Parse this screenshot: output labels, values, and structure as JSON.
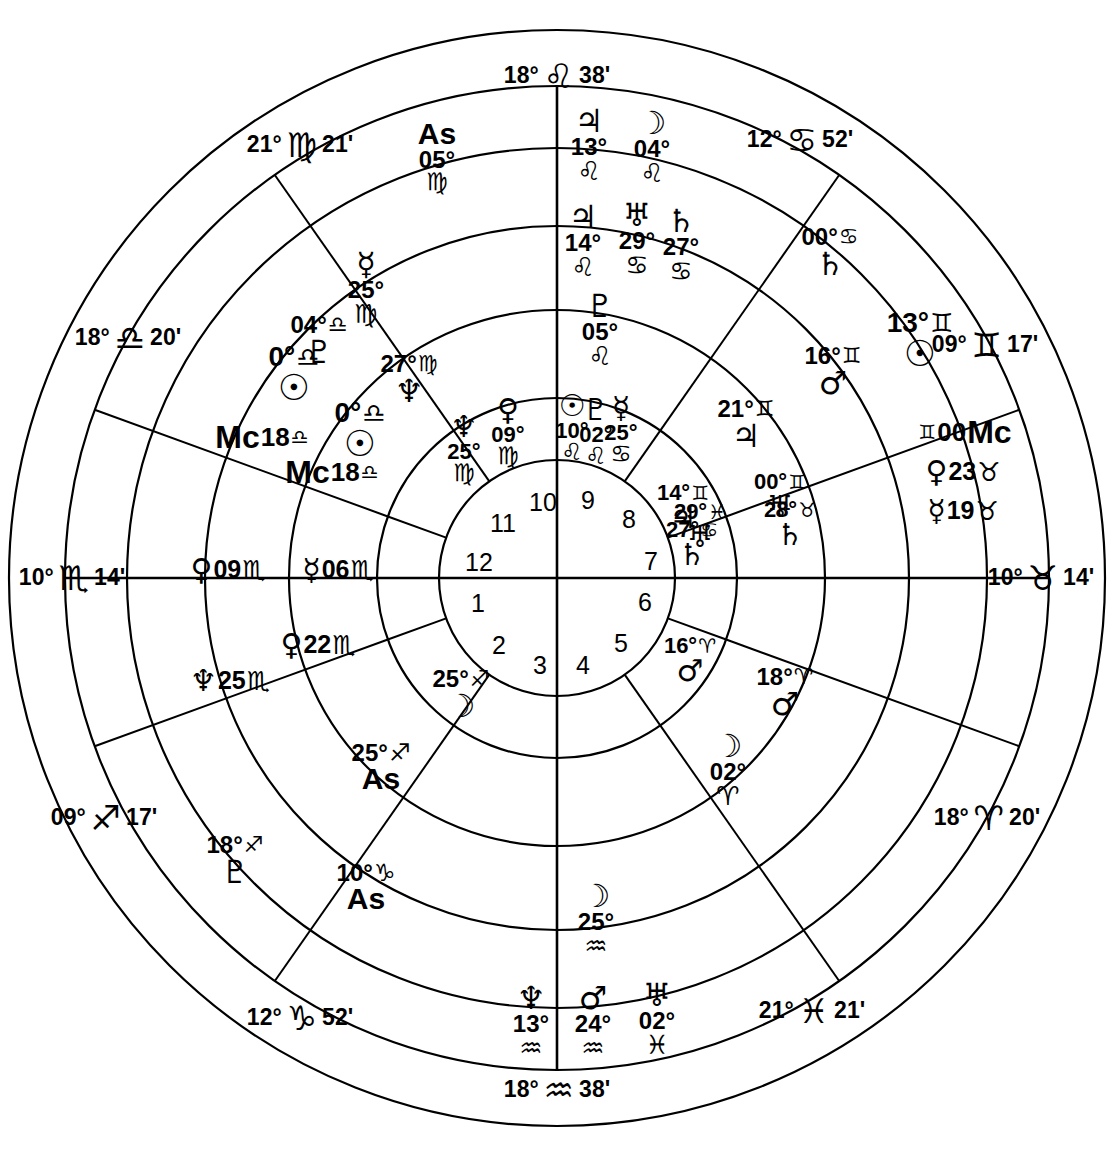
{
  "chart": {
    "type": "astrological-natal-wheel",
    "center": {
      "x": 557,
      "y": 578
    },
    "radii": {
      "outer": 548,
      "signring": 492,
      "ring3": 430,
      "ring2": 352,
      "ring1": 268,
      "housering": 180,
      "hub": 118
    },
    "glyphs": {
      "aries": "♈",
      "taurus": "♉",
      "gemini": "♊",
      "cancer": "♋",
      "leo": "♌",
      "virgo": "♍",
      "libra": "♎",
      "scorpio": "♏",
      "sagittarius": "♐",
      "capricorn": "♑",
      "aquarius": "♒",
      "pisces": "♓",
      "sun": "☉",
      "moon": "☽",
      "mercury": "☿",
      "venus": "♀",
      "mars": "♂",
      "jupiter": "♃",
      "saturn": "♄",
      "uranus": "♅",
      "neptune": "♆",
      "pluto": "♇"
    },
    "house_numbers": [
      {
        "n": "1",
        "x": 478,
        "y": 603
      },
      {
        "n": "2",
        "x": 499,
        "y": 645
      },
      {
        "n": "3",
        "x": 540,
        "y": 665
      },
      {
        "n": "4",
        "x": 583,
        "y": 665
      },
      {
        "n": "5",
        "x": 621,
        "y": 643
      },
      {
        "n": "6",
        "x": 645,
        "y": 602
      },
      {
        "n": "7",
        "x": 651,
        "y": 561
      },
      {
        "n": "8",
        "x": 629,
        "y": 519
      },
      {
        "n": "9",
        "x": 588,
        "y": 500
      },
      {
        "n": "10",
        "x": 543,
        "y": 502
      },
      {
        "n": "11",
        "x": 503,
        "y": 523
      },
      {
        "n": "12",
        "x": 479,
        "y": 562
      }
    ],
    "cusps": [
      {
        "name": "cusp-10-mc",
        "deg": "18°",
        "sign": "leo",
        "min": "38'",
        "x": 557,
        "y": 76,
        "rot": 0
      },
      {
        "name": "cusp-11",
        "deg": "12°",
        "sign": "cancer",
        "min": "52'",
        "x": 800,
        "y": 140,
        "rot": 0
      },
      {
        "name": "cusp-12",
        "deg": "09°",
        "sign": "gemini",
        "min": "17'",
        "x": 985,
        "y": 345,
        "rot": 0
      },
      {
        "name": "cusp-1-asc",
        "deg": "10°",
        "sign": "taurus",
        "min": "14'",
        "x": 1041,
        "y": 578,
        "rot": 0
      },
      {
        "name": "cusp-2",
        "deg": "18°",
        "sign": "aries",
        "min": "20'",
        "x": 987,
        "y": 818,
        "rot": 0
      },
      {
        "name": "cusp-3",
        "deg": "21°",
        "sign": "pisces",
        "min": "21'",
        "x": 812,
        "y": 1011,
        "rot": 0
      },
      {
        "name": "cusp-4-ic",
        "deg": "18°",
        "sign": "aquarius",
        "min": "38'",
        "x": 557,
        "y": 1090,
        "rot": 0
      },
      {
        "name": "cusp-5",
        "deg": "12°",
        "sign": "capricorn",
        "min": "52'",
        "x": 300,
        "y": 1018,
        "rot": 0
      },
      {
        "name": "cusp-6",
        "deg": "09°",
        "sign": "sagittarius",
        "min": "17'",
        "x": 104,
        "y": 818,
        "rot": 0
      },
      {
        "name": "cusp-7-dsc",
        "deg": "10°",
        "sign": "scorpio",
        "min": "14'",
        "x": 72,
        "y": 578,
        "rot": 0
      },
      {
        "name": "cusp-8",
        "deg": "18°",
        "sign": "libra",
        "min": "20'",
        "x": 128,
        "y": 338,
        "rot": 0
      },
      {
        "name": "cusp-9",
        "deg": "21°",
        "sign": "virgo",
        "min": "21'",
        "x": 300,
        "y": 145,
        "rot": 0
      }
    ],
    "placements": [
      {
        "name": "ring3-asc-virgo",
        "ring": "ring3",
        "body": "As",
        "deg": "05°",
        "sign": "virgo",
        "x": 437,
        "y": 157,
        "layout": "as-stack",
        "size": 30
      },
      {
        "name": "ring3-jupiter-leo",
        "ring": "ring3",
        "body": "jupiter",
        "deg": "13°",
        "sign": "leo",
        "x": 589,
        "y": 145,
        "layout": "v-stack",
        "size": 28
      },
      {
        "name": "ring3-moon-leo",
        "ring": "ring3",
        "body": "moon",
        "deg": "04°",
        "sign": "leo",
        "x": 652,
        "y": 147,
        "layout": "v-stack",
        "size": 28
      },
      {
        "name": "ring3-saturn-cancer",
        "ring": "ring3",
        "body": "saturn",
        "deg": "00°",
        "sign": "cancer",
        "x": 830,
        "y": 253,
        "layout": "diag-1",
        "size": 28
      },
      {
        "name": "ring3-mars-gemini",
        "ring": "ring3",
        "body": "mars",
        "deg": "16°",
        "sign": "gemini",
        "x": 833,
        "y": 372,
        "layout": "diag-2",
        "size": 28
      },
      {
        "name": "ring3-sun-gemini",
        "ring": "ring3",
        "body": "sun",
        "deg": "13°",
        "sign": "gemini",
        "x": 920,
        "y": 340,
        "layout": "diag-2",
        "size": 32
      },
      {
        "name": "ring3-mc-gemini",
        "ring": "ring3",
        "body": "Mc",
        "deg": "00°",
        "sign": "gemini",
        "x": 965,
        "y": 432,
        "layout": "mc",
        "size": 30
      },
      {
        "name": "ring3-venus-taurus",
        "ring": "ring3",
        "body": "venus",
        "deg": "23°",
        "sign": "taurus",
        "x": 963,
        "y": 472,
        "layout": "h-row",
        "size": 28
      },
      {
        "name": "ring3-mercury-taurus",
        "ring": "ring3",
        "body": "mercury",
        "deg": "19°",
        "sign": "taurus",
        "x": 963,
        "y": 511,
        "layout": "h-row",
        "size": 28
      },
      {
        "name": "ring3-mars-aries",
        "ring": "ring3",
        "body": "mars",
        "deg": "18°",
        "sign": "aries",
        "x": 785,
        "y": 693,
        "layout": "diag-3",
        "size": 28
      },
      {
        "name": "ring3-moon-aries",
        "ring": "ring3",
        "body": "moon",
        "deg": "02°",
        "sign": "aries",
        "x": 728,
        "y": 770,
        "layout": "v-stack",
        "size": 28
      },
      {
        "name": "ring3-mars-aquarius",
        "ring": "ring3",
        "body": "mars",
        "deg": "24°",
        "sign": "aquarius",
        "x": 593,
        "y": 1022,
        "layout": "v-stack",
        "size": 28
      },
      {
        "name": "ring3-uranus-pisces",
        "ring": "ring3",
        "body": "uranus",
        "deg": "02°",
        "sign": "pisces",
        "x": 657,
        "y": 1019,
        "layout": "v-stack",
        "size": 28
      },
      {
        "name": "ring3-neptune-aqu",
        "ring": "ring3",
        "body": "neptune",
        "deg": "13°",
        "sign": "aquarius",
        "x": 531,
        "y": 1022,
        "layout": "v-stack",
        "size": 28
      },
      {
        "name": "ring3-asc-capricorn",
        "ring": "ring3",
        "body": "As",
        "deg": "10°",
        "sign": "capricorn",
        "x": 366,
        "y": 888,
        "layout": "as-stack2",
        "size": 30
      },
      {
        "name": "ring3-pluto-sag",
        "ring": "ring3",
        "body": "pluto",
        "deg": "18°",
        "sign": "sagittarius",
        "x": 235,
        "y": 861,
        "layout": "diag-4",
        "size": 28
      },
      {
        "name": "ring3-neptune-scorp",
        "ring": "ring3",
        "body": "neptune",
        "deg": "25°",
        "sign": "scorpio",
        "x": 230,
        "y": 681,
        "layout": "h-row",
        "size": 28
      },
      {
        "name": "ring3-venus-scorpio",
        "ring": "ring3",
        "body": "venus",
        "deg": "09°",
        "sign": "scorpio",
        "x": 228,
        "y": 570,
        "layout": "h-row",
        "size": 28
      },
      {
        "name": "ring3-pluto-libra",
        "ring": "ring3",
        "body": "pluto",
        "deg": "04°",
        "sign": "libra",
        "x": 319,
        "y": 341,
        "layout": "diag-5",
        "size": 28
      },
      {
        "name": "ring3-sun-libra",
        "ring": "ring3",
        "body": "sun",
        "deg": "0°",
        "sign": "libra",
        "x": 294,
        "y": 374,
        "layout": "diag-5",
        "size": 32
      },
      {
        "name": "ring3-mc-libra",
        "ring": "ring3",
        "body": "Mc",
        "deg": "18°",
        "sign": "libra",
        "x": 262,
        "y": 437,
        "layout": "mc2",
        "size": 30
      },
      {
        "name": "ring2-jupiter-leo",
        "ring": "ring2",
        "body": "jupiter",
        "deg": "14°",
        "sign": "leo",
        "x": 583,
        "y": 241,
        "layout": "v-stack",
        "size": 28
      },
      {
        "name": "ring2-uranus-cancer",
        "ring": "ring2",
        "body": "uranus",
        "deg": "29°",
        "sign": "cancer",
        "x": 637,
        "y": 239,
        "layout": "v-stack",
        "size": 28
      },
      {
        "name": "ring2-saturn-cancer",
        "ring": "ring2",
        "body": "saturn",
        "deg": "27°",
        "sign": "cancer",
        "x": 681,
        "y": 245,
        "layout": "v-stack",
        "size": 28
      },
      {
        "name": "ring2-jupiter-gem",
        "ring": "ring2",
        "body": "jupiter",
        "deg": "21°",
        "sign": "gemini",
        "x": 746,
        "y": 425,
        "layout": "diag-2",
        "size": 28
      },
      {
        "name": "ring2-uranus-gem",
        "ring": "ring2",
        "body": "uranus",
        "deg": "00°",
        "sign": "gemini",
        "x": 780,
        "y": 497,
        "layout": "diag-2",
        "size": 26
      },
      {
        "name": "ring2-saturn-taurus",
        "ring": "ring2",
        "body": "saturn",
        "deg": "28°",
        "sign": "taurus",
        "x": 790,
        "y": 525,
        "layout": "diag-2",
        "size": 26
      },
      {
        "name": "ring2-jupiter-gem2",
        "ring": "ring2",
        "body": "jupiter",
        "deg": "14°",
        "sign": "gemini",
        "x": 683,
        "y": 508,
        "layout": "diag-2",
        "size": 26
      },
      {
        "name": "ring2-uranus-pisces2",
        "ring": "ring2",
        "body": "uranus",
        "deg": "29°",
        "sign": "pisces",
        "x": 700,
        "y": 527,
        "layout": "diag-2",
        "size": 26
      },
      {
        "name": "ring2-saturn-cancer2",
        "ring": "ring2",
        "body": "saturn",
        "deg": "27°",
        "sign": "cancer",
        "x": 692,
        "y": 545,
        "layout": "diag-2",
        "size": 26
      },
      {
        "name": "ring2-mars-aries",
        "ring": "ring2",
        "body": "mars",
        "deg": "16°",
        "sign": "aries",
        "x": 690,
        "y": 661,
        "layout": "diag-3",
        "size": 26
      },
      {
        "name": "ring2-moon-aquarius",
        "ring": "ring2",
        "body": "moon",
        "deg": "25°",
        "sign": "aquarius",
        "x": 596,
        "y": 920,
        "layout": "v-stack",
        "size": 28
      },
      {
        "name": "ring2-asc-sag",
        "ring": "ring2",
        "body": "As",
        "deg": "25°",
        "sign": "sagittarius",
        "x": 381,
        "y": 768,
        "layout": "as-stack3",
        "size": 30
      },
      {
        "name": "ring2-moon-sag",
        "ring": "ring2",
        "body": "moon",
        "deg": "25°",
        "sign": "sagittarius",
        "x": 461,
        "y": 695,
        "layout": "diag-4",
        "size": 28
      },
      {
        "name": "ring2-venus-scorpio",
        "ring": "ring2",
        "body": "venus",
        "deg": "22°",
        "sign": "scorpio",
        "x": 318,
        "y": 645,
        "layout": "h-row",
        "size": 28
      },
      {
        "name": "ring2-mercury-scorp",
        "ring": "ring2",
        "body": "mercury",
        "deg": "06°",
        "sign": "scorpio",
        "x": 338,
        "y": 570,
        "layout": "h-row",
        "size": 28
      },
      {
        "name": "ring2-mercury-virgo",
        "ring": "ring2",
        "body": "mercury",
        "deg": "25°",
        "sign": "virgo",
        "x": 366,
        "y": 288,
        "layout": "v-stack",
        "size": 28
      },
      {
        "name": "ring2-neptune-virgo",
        "ring": "ring2",
        "body": "neptune",
        "deg": "27°",
        "sign": "virgo",
        "x": 409,
        "y": 380,
        "layout": "diag-5",
        "size": 28
      },
      {
        "name": "ring2-sun-libra",
        "ring": "ring2",
        "body": "sun",
        "deg": "0°",
        "sign": "libra",
        "x": 360,
        "y": 430,
        "layout": "diag-5",
        "size": 32
      },
      {
        "name": "ring2-mc-libra",
        "ring": "ring2",
        "body": "Mc",
        "deg": "18°",
        "sign": "libra",
        "x": 332,
        "y": 472,
        "layout": "mc2",
        "size": 30
      },
      {
        "name": "ring1-pluto-leo",
        "ring": "ring1",
        "body": "pluto",
        "deg": "05°",
        "sign": "leo",
        "x": 600,
        "y": 330,
        "layout": "v-stack",
        "size": 28
      },
      {
        "name": "ring1-sun-leo",
        "ring": "ring1",
        "body": "sun",
        "deg": "10°",
        "sign": "leo",
        "x": 572,
        "y": 428,
        "layout": "cluster",
        "size": 26
      },
      {
        "name": "ring1-pluto-leo2",
        "ring": "ring1",
        "body": "pluto",
        "deg": "02°",
        "sign": "leo",
        "x": 596,
        "y": 432,
        "layout": "cluster",
        "size": 26
      },
      {
        "name": "ring1-mercury-cancer",
        "ring": "ring1",
        "body": "mercury",
        "deg": "25°",
        "sign": "cancer",
        "x": 621,
        "y": 430,
        "layout": "cluster",
        "size": 26
      },
      {
        "name": "ring1-venus-virgo",
        "ring": "ring1",
        "body": "venus",
        "deg": "09°",
        "sign": "virgo",
        "x": 508,
        "y": 432,
        "layout": "v-stack",
        "size": 26
      },
      {
        "name": "ring1-neptune-virgo",
        "ring": "ring1",
        "body": "neptune",
        "deg": "25°",
        "sign": "virgo",
        "x": 464,
        "y": 449,
        "layout": "v-stack",
        "size": 26
      }
    ]
  }
}
